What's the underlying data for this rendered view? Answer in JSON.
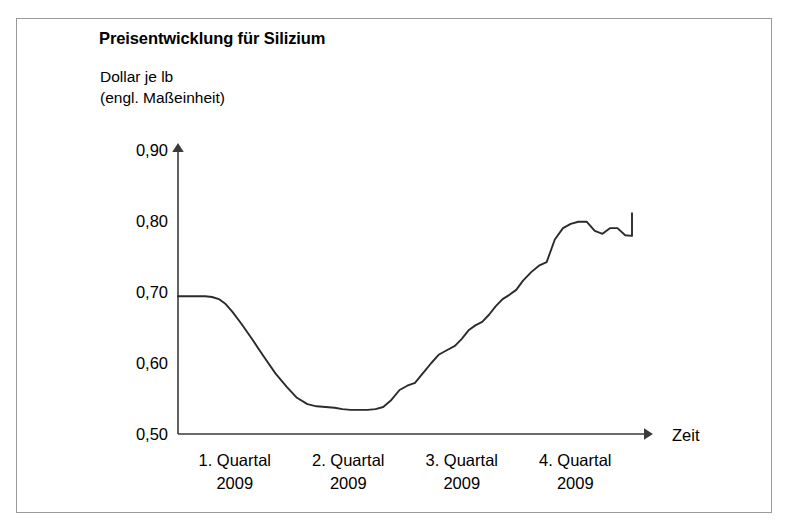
{
  "figure": {
    "title": "Preisentwicklung für Silizium",
    "unit_caption_line1": "Dollar je lb",
    "unit_caption_line2": "(engl. Maßeinheit)",
    "line_color": "#2b2b2b",
    "axis_color": "#3a3a3a",
    "frame_color": "#9a9a9a"
  },
  "chart_data": {
    "type": "line",
    "title": "Preisentwicklung für Silizium",
    "subtitle": "Dollar je lb (engl. Maßeinheit)",
    "xlabel": "Zeit",
    "ylabel": "Dollar je lb (engl. Maßeinheit)",
    "ylim": [
      0.5,
      0.9
    ],
    "yticks": [
      0.5,
      0.6,
      0.7,
      0.8,
      0.9
    ],
    "ytick_labels": [
      "0,50",
      "0,60",
      "0,70",
      "0,80",
      "0,90"
    ],
    "xlim": [
      0,
      1
    ],
    "xtick_labels": [
      "1. Quartal\n2009",
      "2. Quartal\n2009",
      "3. Quartal\n2009",
      "4. Quartal\n2009"
    ],
    "x_categories": [
      {
        "line1": "1. Quartal",
        "line2": "2009",
        "position": 0.125
      },
      {
        "line1": "2. Quartal",
        "line2": "2009",
        "position": 0.375
      },
      {
        "line1": "3. Quartal",
        "line2": "2009",
        "position": 0.625
      },
      {
        "line1": "4. Quartal",
        "line2": "2009",
        "position": 0.875
      }
    ],
    "grid": false,
    "legend": null,
    "series": [
      {
        "name": "Siliziumpreis",
        "color": "#2b2b2b",
        "x": [
          0.0,
          0.02,
          0.04,
          0.06,
          0.075,
          0.09,
          0.105,
          0.12,
          0.14,
          0.165,
          0.19,
          0.215,
          0.24,
          0.262,
          0.285,
          0.305,
          0.325,
          0.345,
          0.362,
          0.38,
          0.4,
          0.418,
          0.435,
          0.452,
          0.47,
          0.488,
          0.505,
          0.522,
          0.54,
          0.558,
          0.575,
          0.592,
          0.61,
          0.625,
          0.64,
          0.655,
          0.67,
          0.685,
          0.7,
          0.715,
          0.73,
          0.745,
          0.76,
          0.778,
          0.795,
          0.812,
          0.83,
          0.848,
          0.865,
          0.882,
          0.9,
          0.918,
          0.935,
          0.952,
          0.968,
          0.985,
          1.0
        ],
        "y": [
          0.694,
          0.694,
          0.694,
          0.694,
          0.693,
          0.69,
          0.683,
          0.672,
          0.655,
          0.632,
          0.608,
          0.585,
          0.566,
          0.551,
          0.542,
          0.539,
          0.538,
          0.537,
          0.535,
          0.534,
          0.534,
          0.534,
          0.535,
          0.538,
          0.548,
          0.562,
          0.568,
          0.572,
          0.586,
          0.6,
          0.612,
          0.618,
          0.624,
          0.634,
          0.646,
          0.653,
          0.658,
          0.668,
          0.68,
          0.69,
          0.696,
          0.703,
          0.716,
          0.728,
          0.737,
          0.742,
          0.774,
          0.79,
          0.796,
          0.799,
          0.799,
          0.786,
          0.782,
          0.79,
          0.79,
          0.78,
          0.779
        ],
        "y_tail": [
          0.79,
          0.8,
          0.805,
          0.811
        ]
      }
    ],
    "annotations": [
      {
        "text": "Zeit",
        "role": "x-axis-arrow-label"
      }
    ]
  }
}
